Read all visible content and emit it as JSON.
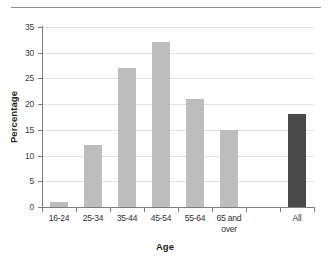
{
  "chart_data": {
    "type": "bar",
    "title": "",
    "subtitle": "",
    "xlabel": "Age",
    "ylabel": "Percentage",
    "categories": [
      "16-24",
      "25-34",
      "35-44",
      "45-54",
      "55-64",
      "65 and over",
      "",
      "All"
    ],
    "values": [
      1,
      12,
      27,
      32,
      21,
      15,
      null,
      18
    ],
    "bar_colors": [
      "#bdbdbd",
      "#bdbdbd",
      "#bdbdbd",
      "#bdbdbd",
      "#bdbdbd",
      "#bdbdbd",
      null,
      "#4a4a4a"
    ],
    "ylim": [
      0,
      35
    ],
    "ytick_step": 5,
    "yticks": [
      "0",
      "5",
      "10",
      "15",
      "20",
      "25",
      "30",
      "35"
    ],
    "grid": "horizontal",
    "legend": "none",
    "annotations": []
  },
  "figure": {
    "axis_line_color": "#7d7d7d",
    "gridline_color": "#e2e2e2",
    "background": "#ffffff",
    "top_rule_color": "#8e8e8e"
  }
}
